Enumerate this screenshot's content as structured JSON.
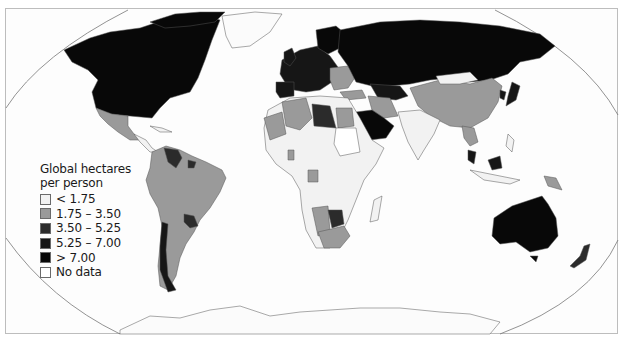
{
  "map": {
    "subject": "Ecological footprint by country",
    "projection": "Robinson-style world map",
    "colors": {
      "ocean": "#fdfdfd",
      "border": "#555555",
      "frame": "#bdbdbd",
      "lt_1_75": "#f2f2f2",
      "1_75_3_50": "#9a9a9a",
      "3_50_5_25": "#2b2b2b",
      "5_25_7_00": "#161616",
      "gt_7_00": "#080808",
      "no_data": "#ffffff"
    }
  },
  "legend": {
    "title_line1": "Global hectares",
    "title_line2": "per person",
    "items": [
      {
        "label": "< 1.75",
        "color": "#f2f2f2"
      },
      {
        "label": "1.75 – 3.50",
        "color": "#9a9a9a"
      },
      {
        "label": "3.50 – 5.25",
        "color": "#2b2b2b"
      },
      {
        "label": "5.25 – 7.00",
        "color": "#161616"
      },
      {
        "label": "> 7.00",
        "color": "#080808"
      },
      {
        "label": "No data",
        "color": "#ffffff"
      }
    ]
  }
}
